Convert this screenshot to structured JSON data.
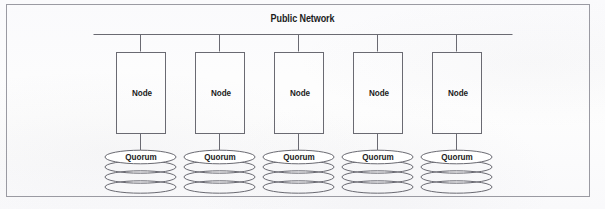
{
  "figure": {
    "title": "Public Network",
    "background_color": "#fdfdfd",
    "frame_color": "#9a9aa2",
    "line_color": "#6a6a72",
    "text_color": "#1c1c1c"
  },
  "network": {
    "bus_label": "Public Network"
  },
  "nodes": [
    {
      "label": "Node",
      "storage_label": "Quorum",
      "disk_layers": 4
    },
    {
      "label": "Node",
      "storage_label": "Quorum",
      "disk_layers": 4
    },
    {
      "label": "Node",
      "storage_label": "Quorum",
      "disk_layers": 4
    },
    {
      "label": "Node",
      "storage_label": "Quorum",
      "disk_layers": 4
    },
    {
      "label": "Node",
      "storage_label": "Quorum",
      "disk_layers": 4
    }
  ]
}
